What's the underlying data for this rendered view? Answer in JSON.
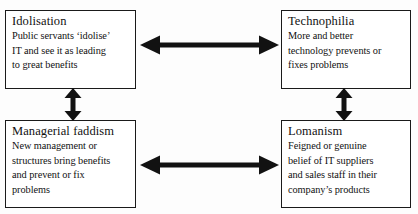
{
  "diagram": {
    "type": "concept-map",
    "nodes": [
      {
        "id": "idolisation",
        "title": "Idolisation",
        "lines": [
          "Public servants ‘idolise’",
          "IT and see it as leading",
          "to great benefits"
        ]
      },
      {
        "id": "technophilia",
        "title": "Technophilia",
        "lines": [
          "More and better",
          "technology prevents or",
          "fixes problems"
        ]
      },
      {
        "id": "managerial-faddism",
        "title": "Managerial faddism",
        "lines": [
          "New management or",
          "structures bring benefits",
          "and prevent or fix",
          "problems"
        ]
      },
      {
        "id": "lomanism",
        "title": "Lomanism",
        "lines": [
          "Feigned or genuine",
          "belief of IT suppliers",
          "and sales staff in their",
          "company’s products"
        ]
      }
    ],
    "edges": [
      {
        "id": "idolisation-technophilia",
        "from": "idolisation",
        "to": "technophilia",
        "direction": "bidirectional",
        "orientation": "horizontal"
      },
      {
        "id": "managerial-lomanism",
        "from": "managerial-faddism",
        "to": "lomanism",
        "direction": "bidirectional",
        "orientation": "horizontal"
      },
      {
        "id": "idolisation-managerial",
        "from": "idolisation",
        "to": "managerial-faddism",
        "direction": "bidirectional",
        "orientation": "vertical"
      },
      {
        "id": "technophilia-lomanism",
        "from": "technophilia",
        "to": "lomanism",
        "direction": "bidirectional",
        "orientation": "vertical"
      }
    ],
    "colors": {
      "background": "#fdfdfd",
      "box_border": "#1a1a1a",
      "box_fill": "#ffffff",
      "text": "#111111",
      "arrow": "#121212"
    }
  }
}
